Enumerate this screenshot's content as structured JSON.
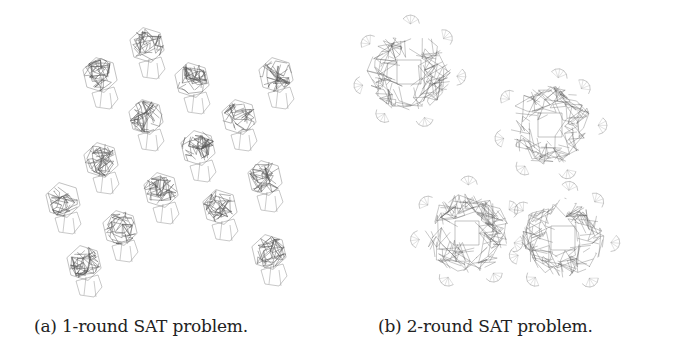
{
  "figure": {
    "panels": [
      {
        "id": "a",
        "caption": "(a) 1-round SAT problem.",
        "cluster_count": 17,
        "cluster_type": "small-dense-graph-components",
        "clusters": [
          [
            147,
            45
          ],
          [
            100,
            75
          ],
          [
            192,
            80
          ],
          [
            276,
            75
          ],
          [
            146,
            117
          ],
          [
            239,
            117
          ],
          [
            198,
            148
          ],
          [
            101,
            160
          ],
          [
            265,
            178
          ],
          [
            63,
            200
          ],
          [
            161,
            190
          ],
          [
            220,
            207
          ],
          [
            120,
            228
          ],
          [
            84,
            263
          ],
          [
            269,
            252
          ],
          [
            180,
            0
          ],
          [
            150,
            0
          ]
        ]
      },
      {
        "id": "b",
        "caption": "(b) 2-round SAT problem.",
        "cluster_count": 4,
        "cluster_type": "large-dense-graph-components-with-hole",
        "clusters": [
          [
            67,
            72
          ],
          [
            208,
            125
          ],
          [
            125,
            233
          ],
          [
            221,
            238
          ]
        ]
      }
    ],
    "colors": {
      "edge": "#555555",
      "background": "#ffffff",
      "caption": "#222222"
    }
  }
}
